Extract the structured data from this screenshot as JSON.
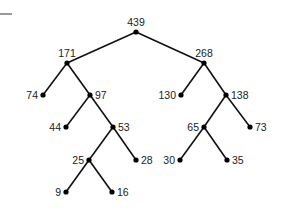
{
  "diagram": {
    "type": "binary-tree",
    "nodes": [
      {
        "id": "n439",
        "value": "439",
        "parent": null,
        "label_side": "top"
      },
      {
        "id": "n171",
        "value": "171",
        "parent": "n439",
        "label_side": "top"
      },
      {
        "id": "n268",
        "value": "268",
        "parent": "n439",
        "label_side": "top"
      },
      {
        "id": "n74",
        "value": "74",
        "parent": "n171",
        "label_side": "left"
      },
      {
        "id": "n97",
        "value": "97",
        "parent": "n171",
        "label_side": "right"
      },
      {
        "id": "n130",
        "value": "130",
        "parent": "n268",
        "label_side": "left"
      },
      {
        "id": "n138",
        "value": "138",
        "parent": "n268",
        "label_side": "right"
      },
      {
        "id": "n44",
        "value": "44",
        "parent": "n97",
        "label_side": "left"
      },
      {
        "id": "n53",
        "value": "53",
        "parent": "n97",
        "label_side": "right"
      },
      {
        "id": "n65",
        "value": "65",
        "parent": "n138",
        "label_side": "left"
      },
      {
        "id": "n73",
        "value": "73",
        "parent": "n138",
        "label_side": "right"
      },
      {
        "id": "n25",
        "value": "25",
        "parent": "n53",
        "label_side": "left"
      },
      {
        "id": "n28",
        "value": "28",
        "parent": "n53",
        "label_side": "right"
      },
      {
        "id": "n30",
        "value": "30",
        "parent": "n65",
        "label_side": "left"
      },
      {
        "id": "n35",
        "value": "35",
        "parent": "n65",
        "label_side": "right"
      },
      {
        "id": "n9",
        "value": "9",
        "parent": "n25",
        "label_side": "left"
      },
      {
        "id": "n16",
        "value": "16",
        "parent": "n25",
        "label_side": "right"
      }
    ]
  }
}
